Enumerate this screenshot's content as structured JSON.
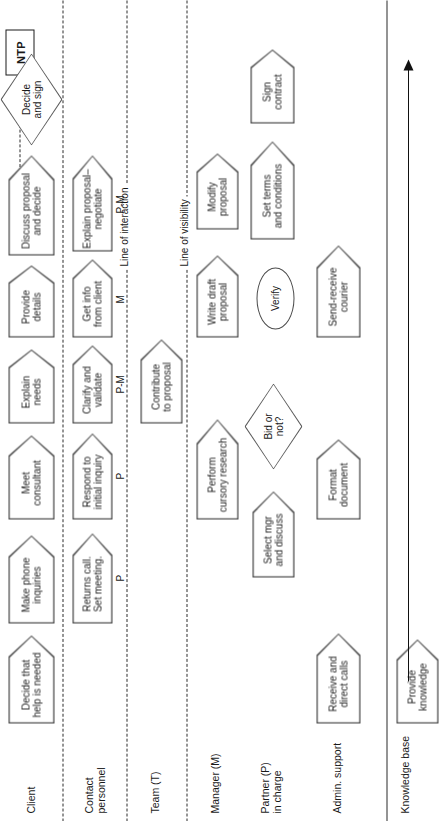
{
  "diagram": {
    "ntp_box": {
      "label": "NTP"
    },
    "lines": [
      {
        "name": "line-of-interaction",
        "label": "Line of interaction"
      },
      {
        "name": "line-of-visibility",
        "label": "Line of visibility"
      }
    ],
    "lanes": [
      {
        "id": "client",
        "label": "Client"
      },
      {
        "id": "contact",
        "label": "Contact\npersonnel"
      },
      {
        "id": "team",
        "label": "Team (T)"
      },
      {
        "id": "manager",
        "label": "Manager (M)"
      },
      {
        "id": "partner",
        "label": "Partner (P)\nin charge"
      },
      {
        "id": "admin",
        "label": "Admin. support"
      },
      {
        "id": "knowledge",
        "label": "Knowledge base"
      }
    ],
    "nodes": [
      {
        "id": "n1",
        "lane": "client",
        "shape": "pentagon",
        "label": "Decide that\nhelp is needed"
      },
      {
        "id": "n2",
        "lane": "client",
        "shape": "pentagon",
        "label": "Make phone\ninquiries"
      },
      {
        "id": "n3",
        "lane": "client",
        "shape": "pentagon",
        "label": "Meet\nconsultant"
      },
      {
        "id": "n4",
        "lane": "client",
        "shape": "pentagon",
        "label": "Explain\nneeds"
      },
      {
        "id": "n5",
        "lane": "client",
        "shape": "pentagon",
        "label": "Provide\ndetails"
      },
      {
        "id": "n6",
        "lane": "client",
        "shape": "pentagon",
        "label": "Discuss proposal\nand decide"
      },
      {
        "id": "n7",
        "lane": "client",
        "shape": "diamond",
        "label": "Decide\nand sign"
      },
      {
        "id": "n8",
        "lane": "contact",
        "shape": "pentagon",
        "label": "Returns call.\nSet meeting.",
        "role": "P"
      },
      {
        "id": "n9",
        "lane": "contact",
        "shape": "pentagon",
        "label": "Respond to\ninitial inquiry",
        "role": "P"
      },
      {
        "id": "n10",
        "lane": "contact",
        "shape": "pentagon",
        "label": "Clarify and\nvalidate",
        "role": "P-M"
      },
      {
        "id": "n11",
        "lane": "contact",
        "shape": "pentagon",
        "label": "Get info\nfrom client",
        "role": "M"
      },
      {
        "id": "n12",
        "lane": "contact",
        "shape": "pentagon",
        "label": "Explain proposal–\nnegotiate",
        "role": "P-M"
      },
      {
        "id": "n13",
        "lane": "team",
        "shape": "pentagon",
        "label": "Contribute\nto proposal"
      },
      {
        "id": "n14",
        "lane": "manager",
        "shape": "pentagon",
        "label": "Perform\ncursory research"
      },
      {
        "id": "n15",
        "lane": "manager",
        "shape": "pentagon",
        "label": "Write draft\nproposal"
      },
      {
        "id": "n16",
        "lane": "manager",
        "shape": "pentagon",
        "label": "Modify\nproposal"
      },
      {
        "id": "n17",
        "lane": "partner",
        "shape": "pentagon",
        "label": "Select mgr\nand discuss"
      },
      {
        "id": "n18",
        "lane": "partner",
        "shape": "diamond",
        "label": "Bid or\nnot?"
      },
      {
        "id": "n19",
        "lane": "partner",
        "shape": "ellipse",
        "label": "Verify"
      },
      {
        "id": "n20",
        "lane": "partner",
        "shape": "pentagon",
        "label": "Set terms\nand conditions"
      },
      {
        "id": "n21",
        "lane": "partner",
        "shape": "pentagon",
        "label": "Sign\ncontract"
      },
      {
        "id": "n22",
        "lane": "admin",
        "shape": "pentagon",
        "label": "Receive and\ndirect calls"
      },
      {
        "id": "n23",
        "lane": "admin",
        "shape": "pentagon",
        "label": "Format\ndocument"
      },
      {
        "id": "n24",
        "lane": "admin",
        "shape": "pentagon",
        "label": "Send-receive\ncourier"
      },
      {
        "id": "n25",
        "lane": "knowledge",
        "shape": "pentagon",
        "label": "Provide\nknowledge"
      }
    ],
    "colors": {
      "shape_stroke": "#4a4a4a",
      "divider": "#2b2b2b",
      "text": "#1a1a1a",
      "background": "#ffffff",
      "arrow": "#111111"
    }
  }
}
